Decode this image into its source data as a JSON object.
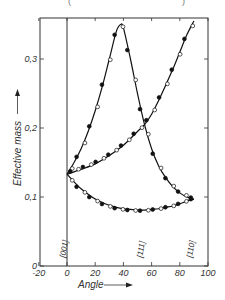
{
  "chart_data": {
    "type": "line",
    "title": "",
    "top_caption_fragment": "( )",
    "xlabel": "Angle",
    "ylabel": "Effective mass",
    "xlim": [
      -20,
      100
    ],
    "ylim": [
      0,
      0.36
    ],
    "x_ticks": [
      -20,
      0,
      20,
      40,
      60,
      80,
      100
    ],
    "x_tick_labels": [
      "-20",
      "0",
      "20",
      "40",
      "60",
      "80",
      "100"
    ],
    "y_ticks": [
      0,
      0.1,
      0.2,
      0.3
    ],
    "y_tick_labels": [
      "0",
      "0,1",
      "0,2",
      "0,3"
    ],
    "grid": false,
    "direction_labels": [
      {
        "label": "[001]",
        "angle": 0
      },
      {
        "label": "[111]",
        "angle": 54.7
      },
      {
        "label": "[110]",
        "angle": 90
      }
    ],
    "series": [
      {
        "name": "peak curve",
        "x": [
          0,
          5,
          10,
          15,
          20,
          25,
          30,
          35,
          38,
          40,
          45,
          50,
          55,
          60,
          65,
          70,
          75,
          80,
          85,
          90
        ],
        "values": [
          0.133,
          0.15,
          0.17,
          0.195,
          0.225,
          0.26,
          0.3,
          0.34,
          0.35,
          0.345,
          0.3,
          0.25,
          0.205,
          0.17,
          0.145,
          0.128,
          0.115,
          0.106,
          0.1,
          0.097
        ]
      },
      {
        "name": "rising curve",
        "x": [
          0,
          10,
          20,
          30,
          40,
          50,
          55,
          60,
          65,
          70,
          75,
          80,
          85,
          90
        ],
        "values": [
          0.133,
          0.14,
          0.148,
          0.16,
          0.175,
          0.195,
          0.205,
          0.22,
          0.24,
          0.262,
          0.285,
          0.31,
          0.335,
          0.355
        ]
      },
      {
        "name": "lower curve",
        "x": [
          0,
          5,
          10,
          15,
          20,
          25,
          30,
          35,
          40,
          45,
          50,
          55,
          60,
          65,
          70,
          75,
          80,
          85,
          90
        ],
        "values": [
          0.133,
          0.122,
          0.112,
          0.104,
          0.097,
          0.092,
          0.088,
          0.085,
          0.083,
          0.082,
          0.081,
          0.081,
          0.082,
          0.083,
          0.085,
          0.087,
          0.09,
          0.094,
          0.097
        ]
      }
    ],
    "markers": {
      "filled": "experimental (filled circles)",
      "open": "experimental (open circles)"
    }
  }
}
